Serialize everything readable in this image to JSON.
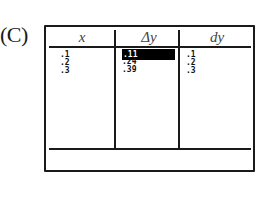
{
  "figure_label": "(C)",
  "table": {
    "columns": [
      {
        "header": "x",
        "values": [
          ".1",
          ".2",
          ".3"
        ]
      },
      {
        "header": "Δy",
        "values": [
          ".11",
          ".24",
          ".39"
        ],
        "selected_index": 0
      },
      {
        "header": "dy",
        "values": [
          ".1",
          ".2",
          ".3"
        ]
      }
    ]
  },
  "colors": {
    "border": "#1a1a1a",
    "highlight_bg": "#000000",
    "highlight_fg": "#ffffff",
    "header_text": "#444444"
  }
}
